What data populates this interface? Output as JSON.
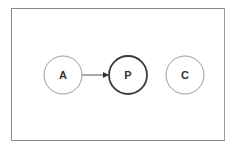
{
  "diagram": {
    "nodes": [
      {
        "id": "A",
        "label": "A",
        "cx": 63,
        "cy": 75,
        "r": 19,
        "stroke": "#9a9a9a",
        "stroke_width": 1
      },
      {
        "id": "P",
        "label": "P",
        "cx": 128,
        "cy": 75,
        "r": 19,
        "stroke": "#3a3a3a",
        "stroke_width": 1.8
      },
      {
        "id": "C",
        "label": "C",
        "cx": 185,
        "cy": 75,
        "r": 19,
        "stroke": "#9a9a9a",
        "stroke_width": 1
      }
    ],
    "edges": [
      {
        "from": "A",
        "to": "P",
        "directed": true
      }
    ]
  }
}
